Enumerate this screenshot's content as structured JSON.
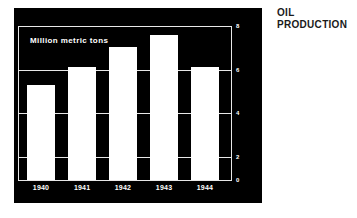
{
  "title": {
    "line1": "OIL",
    "line2": "PRODUCTION"
  },
  "caption": "Million metric tons",
  "colors": {
    "panel_background": "#000000",
    "bar_fill": "#ffffff",
    "gridline": "#e8e8e8",
    "axis_text": "#ffffff",
    "title_text": "#1a1a1a",
    "page_background": "#ffffff"
  },
  "chart_data": {
    "type": "bar",
    "title": "OIL PRODUCTION",
    "subtitle": "Million metric tons",
    "xlabel": "",
    "ylabel": "Million metric tons",
    "categories": [
      "1940",
      "1941",
      "1942",
      "1943",
      "1944"
    ],
    "values": [
      4.5,
      5.3,
      6.2,
      7.5,
      5.3
    ],
    "ylim": [
      0,
      8
    ],
    "yticks": [
      "8",
      "6",
      "4",
      "2",
      "0"
    ],
    "ytick_values": [
      8,
      6,
      4,
      2,
      0
    ],
    "ytick_positions_pct": [
      0,
      28.6,
      56.5,
      85.1,
      100
    ],
    "grid": true,
    "legend": false,
    "axis_note": "zero-to-two interval is visually compressed",
    "bars": [
      {
        "category": "1940",
        "value": 4.5,
        "left_pct": 4.2,
        "width_pct": 13.1,
        "height_pct": 62.0
      },
      {
        "category": "1941",
        "value": 5.3,
        "left_pct": 23.4,
        "width_pct": 13.1,
        "height_pct": 73.4
      },
      {
        "category": "1942",
        "value": 6.2,
        "left_pct": 42.5,
        "width_pct": 13.1,
        "height_pct": 86.4
      },
      {
        "category": "1943",
        "value": 7.5,
        "left_pct": 61.7,
        "width_pct": 13.1,
        "height_pct": 94.2
      },
      {
        "category": "1944",
        "value": 5.3,
        "left_pct": 80.8,
        "width_pct": 13.1,
        "height_pct": 73.4
      }
    ]
  }
}
